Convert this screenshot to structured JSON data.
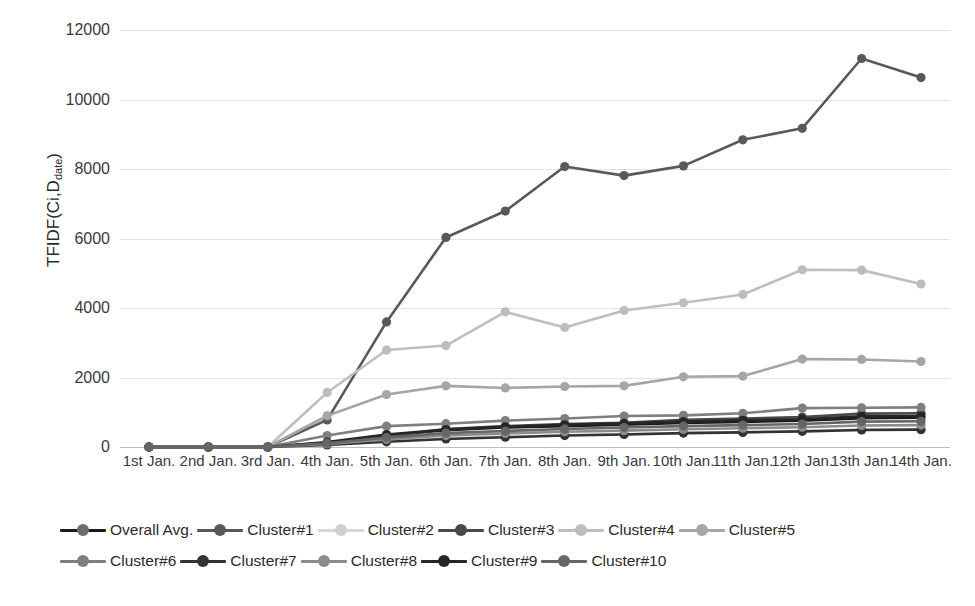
{
  "chart_data": {
    "type": "line",
    "title": "",
    "xlabel": "",
    "ylabel": "TFIDF(Ci,Ddate)",
    "ylabel_main": "TFIDF(Ci,D",
    "ylabel_sub": "date",
    "ylabel_tail": ")",
    "ylim": [
      0,
      12000
    ],
    "yticks": [
      0,
      2000,
      4000,
      6000,
      8000,
      10000,
      12000
    ],
    "grid": true,
    "legend_position": "bottom",
    "categories": [
      "1st Jan.",
      "2nd Jan.",
      "3rd Jan.",
      "4th Jan.",
      "5th Jan.",
      "6th Jan.",
      "7th Jan.",
      "8th Jan.",
      "9th Jan.",
      "10th Jan.",
      "11th Jan.",
      "12th Jan.",
      "13th Jan.",
      "14th Jan."
    ],
    "series": [
      {
        "name": "Overall Avg.",
        "color": "#1a1a1a",
        "marker_color": "#6e6e6e",
        "values": [
          0,
          0,
          0,
          120,
          330,
          480,
          560,
          600,
          640,
          690,
          720,
          760,
          830,
          840
        ]
      },
      {
        "name": "Cluster#1",
        "color": "#595959",
        "marker_color": "#595959",
        "values": [
          0,
          0,
          0,
          780,
          3600,
          6030,
          6790,
          8070,
          7810,
          8090,
          8840,
          9170,
          11180,
          10630
        ]
      },
      {
        "name": "Cluster#2",
        "color": "#d6d6d6",
        "marker_color": "#cfcfcf",
        "values": [
          0,
          0,
          0,
          70,
          160,
          250,
          300,
          340,
          370,
          400,
          430,
          450,
          500,
          510
        ]
      },
      {
        "name": "Cluster#3",
        "color": "#4a4a4a",
        "marker_color": "#4a4a4a",
        "values": [
          0,
          0,
          0,
          100,
          300,
          520,
          600,
          660,
          700,
          780,
          820,
          860,
          960,
          970
        ]
      },
      {
        "name": "Cluster#4",
        "color": "#bfbfbf",
        "marker_color": "#bdbdbd",
        "values": [
          0,
          0,
          0,
          1570,
          2790,
          2920,
          3890,
          3440,
          3930,
          4150,
          4390,
          5100,
          5090,
          4690
        ]
      },
      {
        "name": "Cluster#5",
        "color": "#a6a6a6",
        "marker_color": "#a6a6a6",
        "values": [
          0,
          0,
          0,
          900,
          1510,
          1760,
          1700,
          1740,
          1760,
          2020,
          2040,
          2530,
          2520,
          2460
        ]
      },
      {
        "name": "Cluster#6",
        "color": "#7f7f7f",
        "marker_color": "#7f7f7f",
        "values": [
          0,
          0,
          0,
          330,
          600,
          670,
          760,
          820,
          890,
          910,
          970,
          1120,
          1130,
          1140
        ]
      },
      {
        "name": "Cluster#7",
        "color": "#333333",
        "marker_color": "#333333",
        "values": [
          0,
          0,
          0,
          60,
          150,
          230,
          280,
          330,
          360,
          400,
          420,
          450,
          490,
          500
        ]
      },
      {
        "name": "Cluster#8",
        "color": "#8c8c8c",
        "marker_color": "#8c8c8c",
        "values": [
          0,
          0,
          0,
          90,
          220,
          330,
          390,
          440,
          470,
          510,
          540,
          570,
          620,
          630
        ]
      },
      {
        "name": "Cluster#9",
        "color": "#262626",
        "marker_color": "#262626",
        "values": [
          0,
          0,
          0,
          140,
          360,
          500,
          580,
          640,
          680,
          730,
          770,
          800,
          880,
          890
        ]
      },
      {
        "name": "Cluster#10",
        "color": "#666666",
        "marker_color": "#666666",
        "values": [
          0,
          0,
          0,
          110,
          270,
          400,
          460,
          520,
          560,
          600,
          630,
          660,
          730,
          740
        ]
      }
    ]
  }
}
